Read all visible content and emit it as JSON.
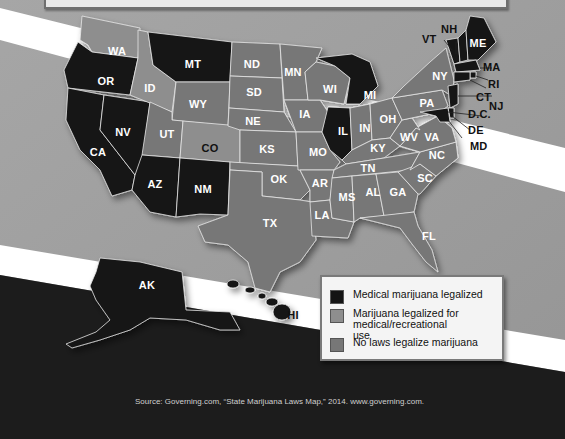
{
  "title_box": {
    "visible_text": ""
  },
  "map": {
    "title": "",
    "categories": {
      "medical": {
        "label": "Medical marijuana legalized",
        "color": "#141414"
      },
      "recreational": {
        "label": "Marijuana legalized for medical/recreational use",
        "color": "#8e8e8e"
      },
      "none": {
        "label": "No laws legalize marijuana",
        "color": "#777777"
      }
    },
    "states": [
      {
        "abbr": "WA",
        "status": "recreational"
      },
      {
        "abbr": "OR",
        "status": "medical"
      },
      {
        "abbr": "CA",
        "status": "medical"
      },
      {
        "abbr": "NV",
        "status": "medical"
      },
      {
        "abbr": "ID",
        "status": "none"
      },
      {
        "abbr": "MT",
        "status": "medical"
      },
      {
        "abbr": "WY",
        "status": "none"
      },
      {
        "abbr": "UT",
        "status": "none"
      },
      {
        "abbr": "CO",
        "status": "recreational"
      },
      {
        "abbr": "AZ",
        "status": "medical"
      },
      {
        "abbr": "NM",
        "status": "medical"
      },
      {
        "abbr": "ND",
        "status": "none"
      },
      {
        "abbr": "SD",
        "status": "none"
      },
      {
        "abbr": "NE",
        "status": "none"
      },
      {
        "abbr": "KS",
        "status": "none"
      },
      {
        "abbr": "OK",
        "status": "none"
      },
      {
        "abbr": "TX",
        "status": "none"
      },
      {
        "abbr": "MN",
        "status": "none"
      },
      {
        "abbr": "IA",
        "status": "none"
      },
      {
        "abbr": "MO",
        "status": "none"
      },
      {
        "abbr": "AR",
        "status": "none"
      },
      {
        "abbr": "LA",
        "status": "none"
      },
      {
        "abbr": "WI",
        "status": "none"
      },
      {
        "abbr": "IL",
        "status": "medical"
      },
      {
        "abbr": "MI",
        "status": "medical"
      },
      {
        "abbr": "IN",
        "status": "none"
      },
      {
        "abbr": "OH",
        "status": "none"
      },
      {
        "abbr": "KY",
        "status": "none"
      },
      {
        "abbr": "TN",
        "status": "none"
      },
      {
        "abbr": "MS",
        "status": "none"
      },
      {
        "abbr": "AL",
        "status": "none"
      },
      {
        "abbr": "GA",
        "status": "none"
      },
      {
        "abbr": "FL",
        "status": "none"
      },
      {
        "abbr": "SC",
        "status": "none"
      },
      {
        "abbr": "NC",
        "status": "none"
      },
      {
        "abbr": "VA",
        "status": "none"
      },
      {
        "abbr": "WV",
        "status": "none"
      },
      {
        "abbr": "PA",
        "status": "none"
      },
      {
        "abbr": "NY",
        "status": "none"
      },
      {
        "abbr": "VT",
        "status": "medical"
      },
      {
        "abbr": "NH",
        "status": "medical"
      },
      {
        "abbr": "ME",
        "status": "medical"
      },
      {
        "abbr": "MA",
        "status": "medical"
      },
      {
        "abbr": "RI",
        "status": "medical"
      },
      {
        "abbr": "CT",
        "status": "medical"
      },
      {
        "abbr": "NJ",
        "status": "medical"
      },
      {
        "abbr": "D.C.",
        "status": "medical"
      },
      {
        "abbr": "DE",
        "status": "medical"
      },
      {
        "abbr": "MD",
        "status": "medical"
      },
      {
        "abbr": "AK",
        "status": "medical"
      },
      {
        "abbr": "HI",
        "status": "medical"
      }
    ]
  },
  "labels": {
    "WA": "WA",
    "OR": "OR",
    "CA": "CA",
    "NV": "NV",
    "ID": "ID",
    "MT": "MT",
    "WY": "WY",
    "UT": "UT",
    "CO": "CO",
    "AZ": "AZ",
    "NM": "NM",
    "ND": "ND",
    "SD": "SD",
    "NE": "NE",
    "KS": "KS",
    "OK": "OK",
    "TX": "TX",
    "MN": "MN",
    "IA": "IA",
    "MO": "MO",
    "AR": "AR",
    "LA": "LA",
    "WI": "WI",
    "IL": "IL",
    "MI": "MI",
    "IN": "IN",
    "OH": "OH",
    "KY": "KY",
    "TN": "TN",
    "MS": "MS",
    "AL": "AL",
    "GA": "GA",
    "FL": "FL",
    "SC": "SC",
    "NC": "NC",
    "VA": "VA",
    "WV": "WV",
    "PA": "PA",
    "NY": "NY",
    "VT": "VT",
    "NH": "NH",
    "ME": "ME",
    "MA": "MA",
    "RI": "RI",
    "CT": "CT",
    "NJ": "NJ",
    "DC": "D.C.",
    "DE": "DE",
    "MD": "MD",
    "AK": "AK",
    "HI": "HI"
  },
  "legend": {
    "items": [
      {
        "label": "Medical marijuana legalized",
        "color": "#141414"
      },
      {
        "label": "Marijuana legalized for medical/recreational use",
        "color": "#8e8e8e"
      },
      {
        "label": "No laws legalize marijuana",
        "color": "#777777"
      }
    ]
  },
  "source": {
    "text": "Source: Governing.com, “State Marijuana Laws Map,” 2014. www.governing.com."
  },
  "colors": {
    "background": "#9d9d9d",
    "stripe": "#ffffff",
    "dark_band": "#1e1e1e",
    "medical": "#141414",
    "recreational": "#8e8e8e",
    "none": "#777777"
  }
}
